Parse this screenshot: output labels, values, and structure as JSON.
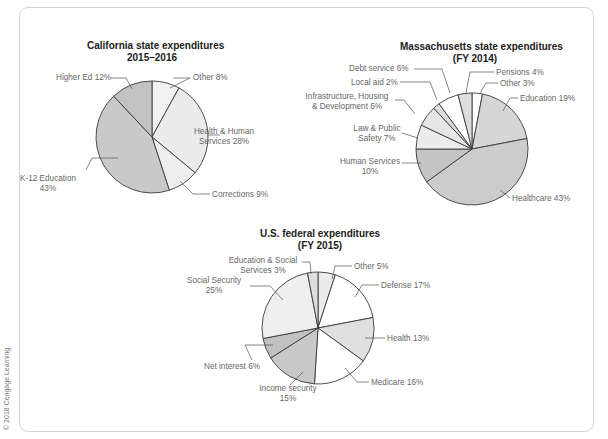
{
  "copyright": "© 2018 Cengage Learning",
  "chart_data": [
    {
      "type": "pie",
      "title": "California state expenditures 2015–2016",
      "title_lines": [
        "California state expenditures",
        "2015–2016"
      ],
      "center": [
        152,
        137
      ],
      "radius": 56,
      "categories": [
        "Other",
        "Health & Human Services",
        "Corrections",
        "K-12 Education",
        "Higher Ed"
      ],
      "values": [
        8,
        28,
        9,
        43,
        12
      ],
      "colors": [
        "#f1f1f1",
        "#ebebeb",
        "#eeeeee",
        "#c9c9c9",
        "#c2c2c2"
      ],
      "labels": [
        {
          "lines": [
            "Other 8%"
          ],
          "x": 193,
          "y": 73,
          "align": "l"
        },
        {
          "lines": [
            "Health & Human",
            "Services 28%"
          ],
          "x": 224,
          "y": 127,
          "align": "c"
        },
        {
          "lines": [
            "Corrections 9%"
          ],
          "x": 212,
          "y": 190,
          "align": "l"
        },
        {
          "lines": [
            "K-12 Education",
            "43%"
          ],
          "x": 48,
          "y": 174,
          "align": "c"
        },
        {
          "lines": [
            "Higher Ed 12%"
          ],
          "x": 56,
          "y": 73,
          "align": "l"
        }
      ],
      "leaders": [
        [
          [
            173,
            78
          ],
          [
            190,
            78
          ],
          [
            170,
            88
          ]
        ],
        [
          [
            208,
            135
          ],
          [
            220,
            135
          ]
        ],
        [
          [
            180,
            181
          ],
          [
            193,
            194
          ],
          [
            210,
            194
          ]
        ],
        [
          [
            118,
            158
          ],
          [
            92,
            158
          ],
          [
            86,
            170
          ]
        ],
        [
          [
            111,
            78
          ],
          [
            126,
            78
          ],
          [
            132,
            89
          ]
        ]
      ]
    },
    {
      "type": "pie",
      "title": "Massachusetts state expenditures (FY 2014)",
      "title_lines": [
        "Massachusetts state expenditures",
        "(FY 2014)"
      ],
      "center": [
        472,
        149
      ],
      "radius": 56,
      "categories": [
        "Other",
        "Education",
        "Healthcare",
        "Human Services",
        "Law & Public Safety",
        "Infrastructure, Housing & Development",
        "Local aid",
        "Debt service",
        "Pensions"
      ],
      "values": [
        3,
        19,
        43,
        10,
        7,
        6,
        2,
        6,
        4
      ],
      "colors": [
        "#ffffff",
        "#d6d6d6",
        "#cccccc",
        "#c4c4c4",
        "#ececec",
        "#e6e6e6",
        "#dddddd",
        "#ffffff",
        "#dddddd"
      ],
      "labels": [
        {
          "lines": [
            "Other 3%"
          ],
          "x": 500,
          "y": 79,
          "align": "l"
        },
        {
          "lines": [
            "Education 19%"
          ],
          "x": 520,
          "y": 94,
          "align": "l"
        },
        {
          "lines": [
            "Healthcare 43%"
          ],
          "x": 512,
          "y": 194,
          "align": "l"
        },
        {
          "lines": [
            "Human Services",
            "10%"
          ],
          "x": 370,
          "y": 157,
          "align": "c"
        },
        {
          "lines": [
            "Law & Public",
            "Safety 7%"
          ],
          "x": 377,
          "y": 124,
          "align": "c"
        },
        {
          "lines": [
            "Infrastructure, Housing",
            "& Development 6%"
          ],
          "x": 347,
          "y": 92,
          "align": "c"
        },
        {
          "lines": [
            "Local aid 2%"
          ],
          "x": 351,
          "y": 78,
          "align": "l"
        },
        {
          "lines": [
            "Debt service 6%"
          ],
          "x": 349,
          "y": 64,
          "align": "l"
        },
        {
          "lines": [
            "Pensions 4%"
          ],
          "x": 496,
          "y": 68,
          "align": "l"
        }
      ],
      "leaders": [
        [
          [
            498,
            83
          ],
          [
            486,
            83
          ],
          [
            480,
            93
          ]
        ],
        [
          [
            518,
            98
          ],
          [
            510,
            98
          ],
          [
            503,
            111
          ]
        ],
        [
          [
            510,
            198
          ],
          [
            500,
            190
          ]
        ],
        [
          [
            402,
            163
          ],
          [
            421,
            163
          ]
        ],
        [
          [
            402,
            133
          ],
          [
            418,
            138
          ]
        ],
        [
          [
            395,
            100
          ],
          [
            404,
            100
          ],
          [
            415,
            114
          ]
        ],
        [
          [
            400,
            82
          ],
          [
            430,
            82
          ],
          [
            437,
            100
          ]
        ],
        [
          [
            414,
            69
          ],
          [
            442,
            69
          ],
          [
            450,
            93
          ]
        ],
        [
          [
            494,
            72
          ],
          [
            470,
            72
          ],
          [
            466,
            93
          ]
        ]
      ]
    },
    {
      "type": "pie",
      "title": "U.S. federal expenditures (FY 2015)",
      "title_lines": [
        "U.S. federal expenditures",
        "(FY 2015)"
      ],
      "center": [
        318,
        328
      ],
      "radius": 56,
      "categories": [
        "Other",
        "Defense",
        "Health",
        "Medicare",
        "Income security",
        "Net interest",
        "Social Security",
        "Education & Social Services"
      ],
      "values": [
        5,
        17,
        13,
        16,
        15,
        6,
        25,
        3
      ],
      "colors": [
        "#ececec",
        "#ffffff",
        "#e0e0e0",
        "#ffffff",
        "#c8c8c8",
        "#c1c1c1",
        "#efefef",
        "#dedede"
      ],
      "labels": [
        {
          "lines": [
            "Other 5%"
          ],
          "x": 354,
          "y": 262,
          "align": "l"
        },
        {
          "lines": [
            "Defense 17%"
          ],
          "x": 381,
          "y": 281,
          "align": "l"
        },
        {
          "lines": [
            "Health 13%"
          ],
          "x": 387,
          "y": 334,
          "align": "l"
        },
        {
          "lines": [
            "Medicare 16%"
          ],
          "x": 371,
          "y": 378,
          "align": "l"
        },
        {
          "lines": [
            "Income security",
            "15%"
          ],
          "x": 288,
          "y": 384,
          "align": "c"
        },
        {
          "lines": [
            "Net interest 6%"
          ],
          "x": 204,
          "y": 362,
          "align": "l"
        },
        {
          "lines": [
            "Social Security",
            "25%"
          ],
          "x": 214,
          "y": 276,
          "align": "c"
        },
        {
          "lines": [
            "Education & Social",
            "Services 3%"
          ],
          "x": 263,
          "y": 256,
          "align": "c"
        }
      ],
      "leaders": [
        [
          [
            352,
            266
          ],
          [
            335,
            266
          ],
          [
            332,
            279
          ]
        ],
        [
          [
            379,
            285
          ],
          [
            362,
            285
          ],
          [
            355,
            297
          ]
        ],
        [
          [
            385,
            338
          ],
          [
            365,
            338
          ]
        ],
        [
          [
            369,
            382
          ],
          [
            357,
            382
          ],
          [
            345,
            368
          ]
        ],
        [
          [
            290,
            385
          ],
          [
            303,
            372
          ]
        ],
        [
          [
            252,
            360
          ],
          [
            245,
            345
          ],
          [
            273,
            345
          ]
        ],
        [
          [
            250,
            286
          ],
          [
            270,
            286
          ],
          [
            283,
            300
          ]
        ],
        [
          [
            302,
            262
          ],
          [
            310,
            262
          ],
          [
            311,
            274
          ]
        ]
      ]
    }
  ]
}
